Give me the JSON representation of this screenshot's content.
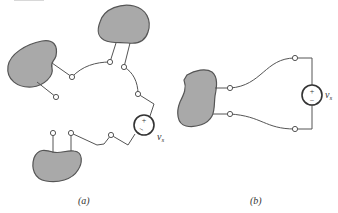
{
  "figure": {
    "panel_a": {
      "label": "(a)",
      "source_label_base": "v",
      "source_label_sub": "s",
      "source_plus": "+",
      "source_minus": "−"
    },
    "panel_b": {
      "label": "(b)",
      "source_label_base": "v",
      "source_label_sub": "s",
      "source_plus": "+",
      "source_minus": "−"
    }
  }
}
